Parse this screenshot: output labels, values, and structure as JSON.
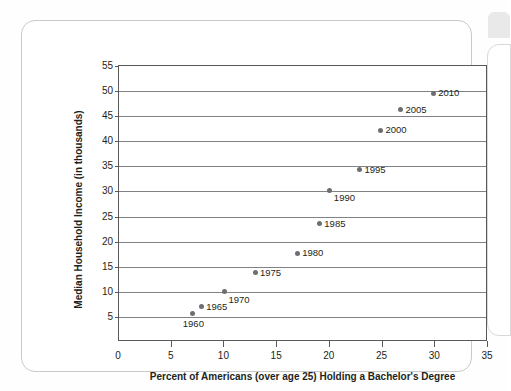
{
  "chart_data": {
    "type": "scatter",
    "title": "",
    "xlabel": "Percent of Americans (over age 25) Holding a Bachelor's Degree",
    "ylabel": "Median Household Income (in thousands)",
    "xlim": [
      0,
      35
    ],
    "ylim": [
      0,
      55
    ],
    "xticks": [
      0,
      5,
      10,
      15,
      20,
      25,
      30,
      35
    ],
    "yticks": [
      5,
      10,
      15,
      20,
      25,
      30,
      35,
      40,
      45,
      50,
      55
    ],
    "xtick_labels": [
      "0",
      "5",
      "10",
      "15",
      "20",
      "25",
      "30",
      "35"
    ],
    "ytick_labels": [
      "5",
      "10",
      "15",
      "20",
      "25",
      "30",
      "35",
      "40",
      "45",
      "50",
      "55"
    ],
    "grid": "horizontal",
    "legend": "none",
    "marker_color": "#6d6e71",
    "gridline_color": "#808285",
    "axis_color": "#58595b",
    "points": [
      {
        "label": "1960",
        "x": 7.0,
        "y": 5.6,
        "label_pos": "below"
      },
      {
        "label": "1965",
        "x": 7.8,
        "y": 7.0,
        "label_pos": "right"
      },
      {
        "label": "1970",
        "x": 10.0,
        "y": 10.0,
        "label_pos": "below-right"
      },
      {
        "label": "1975",
        "x": 12.9,
        "y": 13.8,
        "label_pos": "right"
      },
      {
        "label": "1980",
        "x": 16.9,
        "y": 17.7,
        "label_pos": "right"
      },
      {
        "label": "1985",
        "x": 19.0,
        "y": 23.6,
        "label_pos": "right"
      },
      {
        "label": "1990",
        "x": 20.0,
        "y": 30.2,
        "label_pos": "below-right"
      },
      {
        "label": "1995",
        "x": 22.8,
        "y": 34.3,
        "label_pos": "right"
      },
      {
        "label": "2000",
        "x": 24.8,
        "y": 42.2,
        "label_pos": "right"
      },
      {
        "label": "2005",
        "x": 26.7,
        "y": 46.3,
        "label_pos": "right"
      },
      {
        "label": "2010",
        "x": 29.8,
        "y": 49.6,
        "label_pos": "right"
      }
    ]
  }
}
